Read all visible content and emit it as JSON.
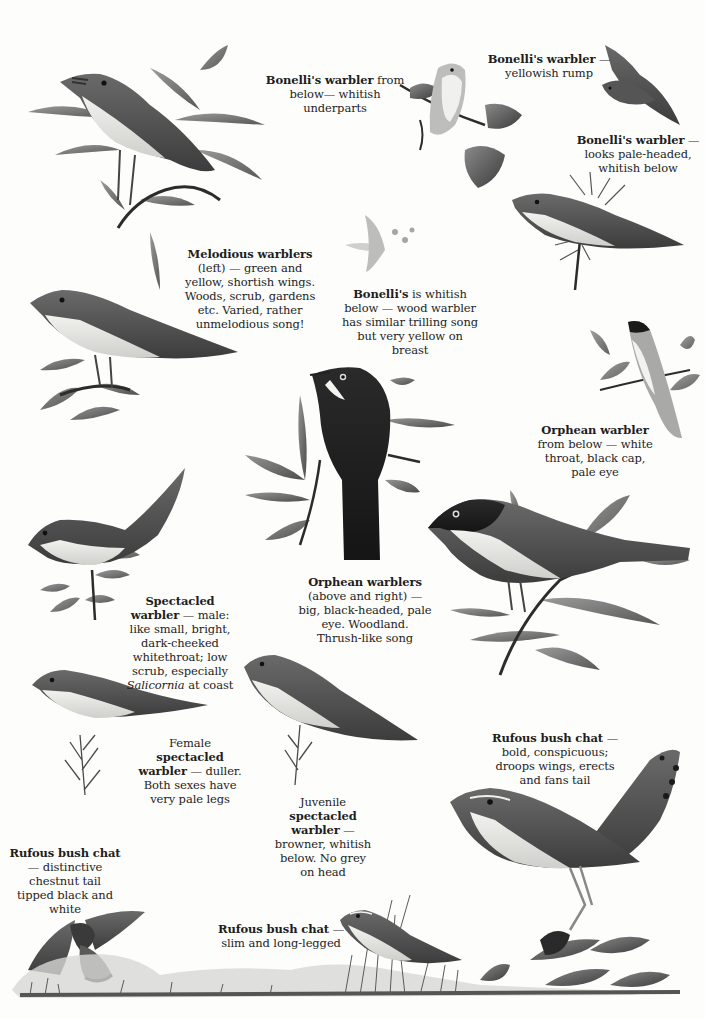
{
  "page": {
    "type": "field-guide-plate",
    "background": "#fdfdfc",
    "ink": "#1e1e1e"
  },
  "captions": {
    "bonelli_below": {
      "bold": "Bonelli's warbler",
      "rest": " from",
      "lines": [
        "below— whitish",
        "underparts"
      ]
    },
    "bonelli_rump": {
      "bold": "Bonelli's warbler",
      "rest": " —",
      "lines": [
        "yellowish rump"
      ]
    },
    "bonelli_pale": {
      "bold": "Bonelli's warbler",
      "rest": " —",
      "lines": [
        "looks pale-headed,",
        "whitish below"
      ]
    },
    "melodious": {
      "bold": "Melodious warblers",
      "lines": [
        "(left) — green and",
        "yellow, shortish wings.",
        "Woods, scrub, gardens",
        "etc. Varied, rather",
        "unmelodious song!"
      ]
    },
    "bonelli_whitish": {
      "bold": "Bonelli's",
      "rest": " is whitish",
      "lines": [
        "below — wood warbler",
        "has similar trilling song",
        "but very yellow on",
        "breast"
      ]
    },
    "orphean_below": {
      "bold": "Orphean warbler",
      "lines": [
        "from below — white",
        "throat, black cap,",
        "pale eye"
      ]
    },
    "spectacled_male": {
      "bold1": "Spectacled",
      "bold2": "warbler",
      "rest2": " — male:",
      "lines": [
        "like small, bright,",
        "dark-cheeked",
        "whitethroat; low",
        "scrub, especially"
      ],
      "italic": "Salicornia",
      "last": " at coast"
    },
    "orphean_main": {
      "bold": "Orphean warblers",
      "lines": [
        "(above and right) —",
        "big, black-headed, pale",
        "eye. Woodland.",
        "Thrush-like song"
      ]
    },
    "spectacled_female": {
      "pre": "Female",
      "bold1": "spectacled",
      "bold2": "warbler",
      "rest2": " — duller.",
      "lines": [
        "Both sexes have",
        "very pale legs"
      ]
    },
    "spectacled_juvenile": {
      "pre": "Juvenile",
      "bold1": "spectacled",
      "bold2": "warbler",
      "rest2": " —",
      "lines": [
        "browner, whitish",
        "below. No grey",
        "on head"
      ]
    },
    "rufous_bold": {
      "bold": "Rufous bush chat",
      "rest": " —",
      "lines": [
        "bold, conspicuous;",
        "droops wings, erects",
        "and fans tail"
      ]
    },
    "rufous_tail": {
      "bold": "Rufous bush chat",
      "lines": [
        "— distinctive",
        "chestnut tail",
        "tipped black and",
        "white"
      ]
    },
    "rufous_slim": {
      "bold": "Rufous bush chat",
      "rest": " —",
      "lines": [
        "slim and long-legged"
      ]
    }
  },
  "illustrations": [
    {
      "id": "melodious-singing",
      "subject": "Melodious warbler singing on willow"
    },
    {
      "id": "melodious-perched",
      "subject": "Melodious warbler on leafy branch"
    },
    {
      "id": "bonelli-below",
      "subject": "Bonelli's warbler from below on bramble"
    },
    {
      "id": "bonelli-flight",
      "subject": "Bonelli's warbler in flight"
    },
    {
      "id": "bonelli-perched",
      "subject": "Bonelli's warbler on conifer sprig"
    },
    {
      "id": "bonelli-small",
      "subject": "Bonelli's warbler small vignette"
    },
    {
      "id": "orphean-below",
      "subject": "Orphean warbler from below"
    },
    {
      "id": "orphean-back",
      "subject": "Orphean warbler from behind on willow"
    },
    {
      "id": "orphean-side",
      "subject": "Orphean warbler side view on willow"
    },
    {
      "id": "spectacled-male",
      "subject": "Spectacled warbler male"
    },
    {
      "id": "spectacled-female",
      "subject": "Spectacled warbler female"
    },
    {
      "id": "spectacled-juvenile",
      "subject": "Spectacled warbler juvenile"
    },
    {
      "id": "rufous-fanned",
      "subject": "Rufous bush chat with fanned tail"
    },
    {
      "id": "rufous-flight",
      "subject": "Rufous bush chat in flight"
    },
    {
      "id": "rufous-grass",
      "subject": "Rufous bush chat in grass"
    },
    {
      "id": "ground-strip",
      "subject": "Landscape ground strip with grass and plants"
    }
  ]
}
